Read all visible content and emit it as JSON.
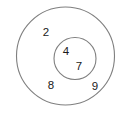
{
  "diagram": {
    "type": "venn-nested",
    "background_color": "#ffffff",
    "stroke_color": "#7f7f7f",
    "text_color": "#1a1a1a",
    "outer_set": {
      "name": "outer-circle",
      "cx": 65.5,
      "cy": 56,
      "r": 49
    },
    "inner_set": {
      "name": "inner-circle",
      "cx": 75,
      "cy": 58.5,
      "r": 21
    },
    "elements": [
      {
        "value": "2",
        "x": 46,
        "y": 33,
        "region": "outer-only"
      },
      {
        "value": "4",
        "x": 66,
        "y": 52,
        "region": "inner"
      },
      {
        "value": "7",
        "x": 79,
        "y": 67,
        "region": "inner"
      },
      {
        "value": "8",
        "x": 51,
        "y": 86,
        "region": "outer-only"
      },
      {
        "value": "9",
        "x": 95,
        "y": 87,
        "region": "outer-only"
      }
    ]
  }
}
